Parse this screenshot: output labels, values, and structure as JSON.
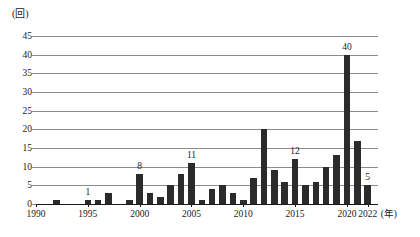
{
  "chart_data": {
    "type": "bar",
    "title": "",
    "subtitle": "",
    "xlabel": "(年)",
    "ylabel": "(回)",
    "y_unit_label": "(回)",
    "x_unit_label": "(年)",
    "grid": true,
    "legend": "none",
    "xlim": [
      1990,
      2023
    ],
    "ylim": [
      0,
      45
    ],
    "y_ticks": [
      0,
      5,
      10,
      15,
      20,
      25,
      30,
      35,
      40,
      45
    ],
    "y_tick_labels": [
      "0",
      "5",
      "10",
      "15",
      "20",
      "25",
      "30",
      "35",
      "40",
      "45"
    ],
    "x_ticks": [
      1990,
      1995,
      2000,
      2005,
      2010,
      2015,
      2020,
      2022
    ],
    "x_tick_labels": [
      "1990",
      "1995",
      "2000",
      "2005",
      "2010",
      "2015",
      "2020",
      "2022"
    ],
    "categories": [
      1990,
      1991,
      1992,
      1993,
      1994,
      1995,
      1996,
      1997,
      1998,
      1999,
      2000,
      2001,
      2002,
      2003,
      2004,
      2005,
      2006,
      2007,
      2008,
      2009,
      2010,
      2011,
      2012,
      2013,
      2014,
      2015,
      2016,
      2017,
      2018,
      2019,
      2020,
      2021,
      2022
    ],
    "values": [
      0,
      0,
      1,
      0,
      0,
      1,
      1,
      3,
      0,
      1,
      8,
      3,
      2,
      5,
      8,
      11,
      1,
      4,
      5,
      3,
      1,
      7,
      20,
      9,
      6,
      12,
      5,
      6,
      10,
      13,
      40,
      17,
      5
    ],
    "annotations": [
      {
        "year": 1995,
        "value": 1,
        "text": "1"
      },
      {
        "year": 2000,
        "value": 8,
        "text": "8"
      },
      {
        "year": 2005,
        "value": 11,
        "text": "11"
      },
      {
        "year": 2015,
        "value": 12,
        "text": "12"
      },
      {
        "year": 2020,
        "value": 40,
        "text": "40"
      },
      {
        "year": 2022,
        "value": 5,
        "text": "5"
      }
    ],
    "colors": {
      "bar": "#2b2b2b",
      "grid": "#8c8c8c",
      "axis": "#1a1a1a",
      "background": "#ffffff",
      "text": "#1a1a1a"
    }
  }
}
